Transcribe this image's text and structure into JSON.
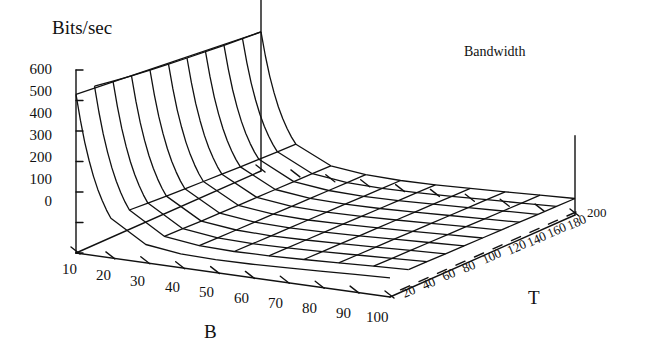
{
  "figure": {
    "zaxis_title": "Bits/sec",
    "plot_title": "Bandwidth",
    "xaxis_name": "B",
    "yaxis_name": "T"
  },
  "chart_data": {
    "type": "line",
    "render": "surface3d-wireframe",
    "title": "Bandwidth",
    "xlabel": "B",
    "ylabel": "T",
    "zlabel": "Bits/sec",
    "grid": true,
    "legend": "none",
    "xlim": [
      10,
      100
    ],
    "ylim": [
      0,
      200
    ],
    "zlim": [
      0,
      600
    ],
    "xticks": [
      10,
      20,
      30,
      40,
      50,
      60,
      70,
      80,
      90,
      100
    ],
    "yticks": [
      20,
      40,
      60,
      80,
      100,
      120,
      140,
      160,
      180,
      200
    ],
    "zticks": [
      0,
      100,
      200,
      300,
      400,
      500,
      600
    ],
    "x": [
      10,
      20,
      30,
      40,
      50,
      60,
      70,
      80,
      90,
      100
    ],
    "y": [
      20,
      40,
      60,
      80,
      100,
      120,
      140,
      160,
      180,
      200
    ],
    "z_note": "z(B,T): sharp decay in B from ~520 at B=10 to a minimum near B=25, then slowly rising; nearly flat in T",
    "z": [
      [
        520,
        130,
        60,
        45,
        42,
        44,
        48,
        53,
        58,
        63
      ],
      [
        510,
        126,
        58,
        44,
        41,
        43,
        47,
        52,
        57,
        62
      ],
      [
        500,
        122,
        56,
        43,
        40,
        42,
        46,
        51,
        56,
        61
      ],
      [
        492,
        119,
        55,
        42,
        39,
        41,
        45,
        50,
        55,
        60
      ],
      [
        485,
        116,
        54,
        41,
        38,
        40,
        44,
        49,
        54,
        59
      ],
      [
        478,
        113,
        53,
        40,
        37,
        39,
        43,
        48,
        53,
        58
      ],
      [
        472,
        110,
        52,
        39,
        36,
        38,
        42,
        47,
        52,
        57
      ],
      [
        466,
        108,
        51,
        38,
        35,
        37,
        41,
        46,
        51,
        56
      ],
      [
        461,
        106,
        50,
        37,
        34,
        36,
        40,
        45,
        50,
        55
      ],
      [
        456,
        104,
        49,
        36,
        33,
        35,
        39,
        44,
        49,
        54
      ]
    ]
  },
  "ztick_labels": [
    "600",
    "500",
    "400",
    "300",
    "200",
    "100",
    "0"
  ],
  "btick_labels": [
    "10",
    "20",
    "30",
    "40",
    "50",
    "60",
    "70",
    "80",
    "90",
    "100"
  ],
  "ttick_labels": [
    "20",
    "40",
    "60",
    "80",
    "100",
    "120",
    "140",
    "160",
    "180",
    "200"
  ]
}
